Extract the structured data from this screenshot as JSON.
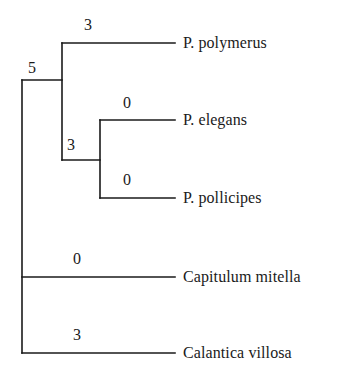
{
  "figure": {
    "type": "phylogenetic-tree",
    "style": "cladogram-rectangular",
    "background_color": "#ffffff",
    "line_color": "#1a1a1a",
    "text_color": "#1a1a1a"
  },
  "taxa": [
    {
      "id": "p-polymerus",
      "label": "P. polymerus",
      "x": 183,
      "y": 43,
      "tip_x": 175
    },
    {
      "id": "p-elegans",
      "label": "P. elegans",
      "x": 183,
      "y": 120,
      "tip_x": 175
    },
    {
      "id": "p-pollicipes",
      "label": "P. pollicipes",
      "x": 183,
      "y": 198,
      "tip_x": 175
    },
    {
      "id": "capitulum-mitella",
      "label": "Capitulum mitella",
      "x": 183,
      "y": 277,
      "tip_x": 175
    },
    {
      "id": "calantica-villosa",
      "label": "Calantica villosa",
      "x": 183,
      "y": 353,
      "tip_x": 175
    }
  ],
  "branch_labels": [
    {
      "id": "label-polymerus",
      "value": "3",
      "x": 88,
      "y": 25,
      "for": "p-polymerus"
    },
    {
      "id": "label-node-a",
      "value": "5",
      "x": 32,
      "y": 68,
      "for": "node-a"
    },
    {
      "id": "label-elegans",
      "value": "0",
      "x": 127,
      "y": 103,
      "for": "p-elegans"
    },
    {
      "id": "label-node-b",
      "value": "3",
      "x": 71,
      "y": 145,
      "for": "node-b"
    },
    {
      "id": "label-pollicipes",
      "value": "0",
      "x": 127,
      "y": 180,
      "for": "p-pollicipes"
    },
    {
      "id": "label-capitulum",
      "value": "0",
      "x": 77,
      "y": 259,
      "for": "capitulum-mitella"
    },
    {
      "id": "label-calantica",
      "value": "3",
      "x": 77,
      "y": 335,
      "for": "calantica-villosa"
    }
  ],
  "tree_geometry": {
    "root_x": 22,
    "root_top_y": 80,
    "root_bottom_y": 353,
    "node_a_x": 62,
    "node_a_top_y": 43,
    "node_a_bottom_y": 160,
    "node_b_x": 100,
    "node_b_top_y": 120,
    "node_b_bottom_y": 198,
    "node_b_stem_y": 160,
    "tip_end_x": 175,
    "stroke_width": 1.6
  }
}
